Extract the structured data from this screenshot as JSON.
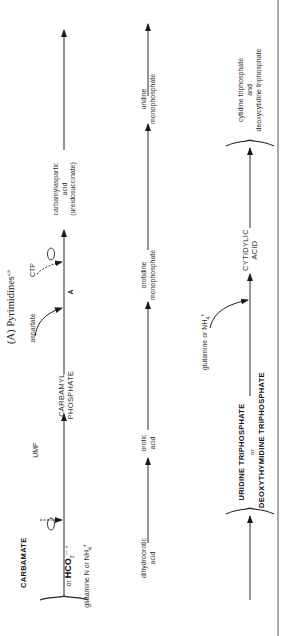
{
  "title": {
    "label": "(A) Pyrimidines",
    "superscript": "a,b"
  },
  "row1": {
    "start": {
      "line1": "CARBAMATE",
      "line2_prefix": "or ",
      "line2_main": "HCO",
      "line2_sub": "3",
      "line2_sup": "—",
      "plus": "+",
      "line3": "glutamine N or NH",
      "line3_sub": "4",
      "line3_sup": "+"
    },
    "inhibitor1": {
      "label": "UMP"
    },
    "intermediate": {
      "line1": "CARBAMYL",
      "line2": "PHOSPHATE"
    },
    "input": {
      "label": "aspartate"
    },
    "enzyme_mark": {
      "label": "A"
    },
    "inhibitor2": {
      "label": "CTP"
    },
    "product": {
      "line1": "carbamylaspartic",
      "line2": "acid",
      "line3": "(ureidosuccinate)"
    }
  },
  "row2": {
    "start": {
      "line1": "dihydroorotic",
      "line2": "acid"
    },
    "step1": {
      "line1": "orotic",
      "line2": "acid"
    },
    "step2": {
      "line1": "orotidine",
      "line2": "monophosphate"
    },
    "step3": {
      "line1": "uridine",
      "line2": "monophosphate"
    }
  },
  "row3": {
    "start": {
      "line1": "URIDINE TRIPHOSPHATE",
      "line2": "or",
      "line3": "DEOXYTHYMIDINE TRIPHOSPHATE"
    },
    "input": {
      "label": "glutamine or NH",
      "sub": "4",
      "sup": "+"
    },
    "intermediate": {
      "line1": "CYTIDYLIC",
      "line2": "ACID"
    },
    "product": {
      "line1": "cytidine triphosphate",
      "line2": "and",
      "line3": "deoxycytidine triphosphate"
    }
  },
  "colors": {
    "line": "#2a2a2a",
    "text": "#333333",
    "background": "#ffffff"
  }
}
